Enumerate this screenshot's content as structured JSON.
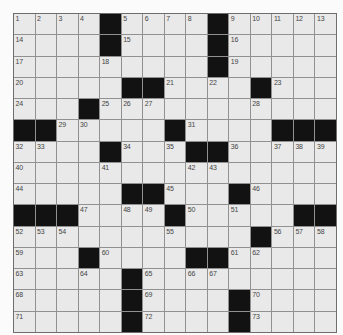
{
  "page": {
    "background_color": "#fbfbfb"
  },
  "crossword": {
    "kind": "crossword-puzzle-grid",
    "rows": 15,
    "cols": 15,
    "highest_clue_number": "73",
    "colors": {
      "cell_fill": "#e9e9e9",
      "black_cell": "#121212",
      "grid_line": "#919191",
      "outer_border": "#6e6e6e",
      "number_color": "#454545"
    },
    "cells": [
      [
        "1",
        "2",
        "3",
        "4",
        "#",
        "5",
        "6",
        "7",
        "8",
        "#",
        "9",
        "10",
        "11",
        "12",
        "13"
      ],
      [
        "14",
        "",
        "",
        "",
        "#",
        "15",
        "",
        "",
        "",
        "#",
        "16",
        "",
        "",
        "",
        ""
      ],
      [
        "17",
        "",
        "",
        "",
        "18",
        "",
        "",
        "",
        "",
        "#",
        "19",
        "",
        "",
        "",
        ""
      ],
      [
        "20",
        "",
        "",
        "",
        "",
        "#",
        "#",
        "21",
        "",
        "22",
        "",
        "#",
        "23",
        "",
        ""
      ],
      [
        "24",
        "",
        "",
        "#",
        "25",
        "26",
        "27",
        "",
        "",
        "",
        "",
        "28",
        "",
        "",
        ""
      ],
      [
        "#",
        "#",
        "29",
        "30",
        "",
        "",
        "",
        "#",
        "31",
        "",
        "",
        "",
        "#",
        "#",
        "#"
      ],
      [
        "32",
        "33",
        "",
        "",
        "#",
        "34",
        "",
        "35",
        "#",
        "#",
        "36",
        "",
        "37",
        "38",
        "39"
      ],
      [
        "40",
        "",
        "",
        "",
        "41",
        "",
        "",
        "",
        "42",
        "43",
        "",
        "",
        "",
        "",
        ""
      ],
      [
        "44",
        "",
        "",
        "",
        "",
        "#",
        "#",
        "45",
        "",
        "",
        "#",
        "46",
        "",
        "",
        ""
      ],
      [
        "#",
        "#",
        "#",
        "47",
        "",
        "48",
        "49",
        "#",
        "50",
        "",
        "51",
        "",
        "",
        "#",
        "#"
      ],
      [
        "52",
        "53",
        "54",
        "",
        "",
        "",
        "",
        "55",
        "",
        "",
        "",
        "#",
        "56",
        "57",
        "58"
      ],
      [
        "59",
        "",
        "",
        "#",
        "60",
        "",
        "",
        "",
        "#",
        "#",
        "61",
        "62",
        "",
        "",
        ""
      ],
      [
        "63",
        "",
        "",
        "64",
        "",
        "#",
        "65",
        "",
        "66",
        "67",
        "",
        "",
        "",
        "",
        ""
      ],
      [
        "68",
        "",
        "",
        "",
        "",
        "#",
        "69",
        "",
        "",
        "",
        "#",
        "70",
        "",
        "",
        ""
      ],
      [
        "71",
        "",
        "",
        "",
        "",
        "#",
        "72",
        "",
        "",
        "",
        "#",
        "73",
        "",
        "",
        ""
      ]
    ]
  }
}
